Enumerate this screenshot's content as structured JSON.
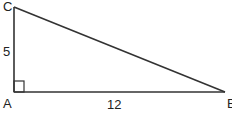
{
  "diagram": {
    "type": "right-triangle",
    "vertices": {
      "C": {
        "label": "C",
        "x": 14,
        "y": 7
      },
      "A": {
        "label": "A",
        "x": 14,
        "y": 91
      },
      "B": {
        "label": "B",
        "x": 225,
        "y": 92
      }
    },
    "sides": {
      "AC": {
        "label": "5"
      },
      "AB": {
        "label": "12"
      }
    },
    "right_angle_at": "A",
    "stroke_color": "#333333"
  }
}
